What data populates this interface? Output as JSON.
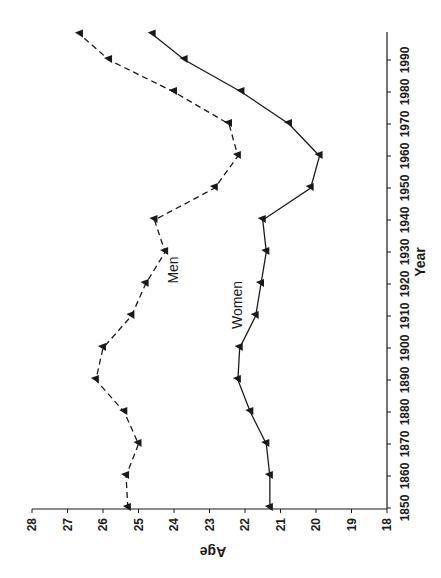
{
  "chart_data": {
    "type": "line",
    "orientation": "rotated-90",
    "title": "",
    "xlabel": "Year",
    "ylabel": "Age",
    "x_ticks": [
      1850,
      1860,
      1870,
      1880,
      1890,
      1900,
      1910,
      1920,
      1930,
      1940,
      1950,
      1960,
      1970,
      1980,
      1990
    ],
    "y_ticks": [
      28,
      27,
      26,
      25,
      24,
      23,
      22,
      21,
      20,
      19,
      18
    ],
    "ylim": [
      18,
      28
    ],
    "xlim": [
      1850,
      1998
    ],
    "grid": false,
    "legend": "inline labels",
    "x": [
      1850,
      1860,
      1870,
      1880,
      1890,
      1900,
      1910,
      1920,
      1930,
      1940,
      1950,
      1960,
      1970,
      1980,
      1990,
      1998
    ],
    "series": [
      {
        "name": "Men",
        "style": "dashed",
        "marker": "triangle",
        "values": [
          25.3,
          25.35,
          25.0,
          25.4,
          26.2,
          26.0,
          25.2,
          24.8,
          24.25,
          24.55,
          22.85,
          22.2,
          22.45,
          24.0,
          25.83,
          26.65
        ]
      },
      {
        "name": "Women",
        "style": "solid",
        "marker": "triangle",
        "values": [
          21.3,
          21.3,
          21.4,
          21.85,
          22.2,
          22.15,
          21.7,
          21.55,
          21.4,
          21.5,
          20.15,
          19.9,
          20.76,
          22.1,
          23.7,
          24.6
        ]
      }
    ],
    "annotations": [
      {
        "text": "Men",
        "near_year": 1925,
        "near_age": 23.8
      },
      {
        "text": "Women",
        "near_year": 1915,
        "near_age": 22.6
      }
    ]
  },
  "labels": {
    "x_axis_title": "Year",
    "y_axis_title": "Age",
    "men": "Men",
    "women": "Women"
  },
  "colors": {
    "line": "#1a1a1a",
    "background": "#ffffff"
  }
}
